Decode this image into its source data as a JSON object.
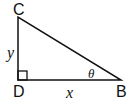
{
  "diagram": {
    "type": "right-triangle",
    "vertices": {
      "C": "C",
      "D": "D",
      "B": "B"
    },
    "sides": {
      "vertical": "y",
      "horizontal": "x"
    },
    "angle_label": "θ",
    "right_angle_at": "D"
  }
}
